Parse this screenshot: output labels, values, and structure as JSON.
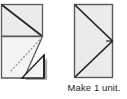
{
  "figure": {
    "type": "sewing-piecing-diagram",
    "caption": "Make 1 unit.",
    "colors": {
      "fabric_fill": "#ebebeb",
      "fabric_fill_light": "#f4f4f4",
      "outline": "#58595b",
      "outline_dark": "#231f20",
      "shadow": "#a7a9ac",
      "dashed_stitch": "#8c8c8c",
      "background": "#ffffff",
      "caption_text": "#231f20"
    },
    "left_diagram": {
      "name": "fold-and-stitch-step",
      "description": "Square patch with drawn diagonal, horizontal fold line, lower section folded down with dashed stitching line and folded-back triangle flap",
      "elements": [
        "upper-square-patch",
        "diagonal-seam-line",
        "horizontal-fold-line",
        "lower-folded-panel",
        "dashed-stitching-line",
        "folded-triangle-flap",
        "flap-drop-shadow"
      ]
    },
    "right_diagram": {
      "name": "finished-unit",
      "description": "Completed rectangular pieced unit with diagonal seams meeting at right edge midpoint forming a chevron",
      "elements": [
        "unit-rectangle",
        "upper-diagonal-seam",
        "lower-diagonal-seam",
        "right-edge-notch"
      ]
    }
  }
}
